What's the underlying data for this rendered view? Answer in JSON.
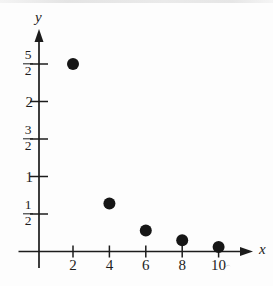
{
  "page": {
    "background": "#fdfdfd",
    "ink": "#1c1c1c",
    "top_band_color": "#e8e8e8",
    "artifact_color": "#d2d2d2"
  },
  "chart_data": {
    "type": "scatter",
    "title": "",
    "xlabel": "x",
    "ylabel": "y",
    "grid": false,
    "legend": null,
    "xlim": [
      0,
      11.9
    ],
    "ylim": [
      0,
      3.05
    ],
    "x_ticks": [
      {
        "value": 2,
        "label": "2"
      },
      {
        "value": 4,
        "label": "4"
      },
      {
        "value": 6,
        "label": "6"
      },
      {
        "value": 8,
        "label": "8"
      },
      {
        "value": 10,
        "label": "10"
      }
    ],
    "y_ticks": [
      {
        "value": 0.5,
        "label": "1/2",
        "numerator": "1",
        "denominator": "2"
      },
      {
        "value": 1,
        "label": "1"
      },
      {
        "value": 1.5,
        "label": "3/2",
        "numerator": "3",
        "denominator": "2"
      },
      {
        "value": 2,
        "label": "2"
      },
      {
        "value": 2.5,
        "label": "5/2",
        "numerator": "5",
        "denominator": "2"
      }
    ],
    "points": [
      {
        "x": 2,
        "y": 2.5
      },
      {
        "x": 4,
        "y": 0.64
      },
      {
        "x": 6,
        "y": 0.28
      },
      {
        "x": 8,
        "y": 0.15
      },
      {
        "x": 10,
        "y": 0.06
      }
    ],
    "point_color": "#161616",
    "point_radius_px": 6
  }
}
